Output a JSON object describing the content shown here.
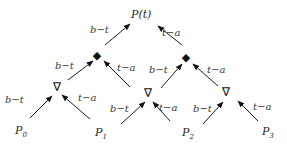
{
  "diagram": {
    "type": "de-casteljau-pyramid",
    "root": {
      "label": "P(t)"
    },
    "weights": {
      "left": "b−t",
      "right": "t−a"
    },
    "level_symbols": {
      "level1": "∇",
      "level2": "◆"
    },
    "control_points": [
      {
        "base": "P",
        "sub": "0"
      },
      {
        "base": "P",
        "sub": "1"
      },
      {
        "base": "P",
        "sub": "2"
      },
      {
        "base": "P",
        "sub": "3"
      }
    ],
    "edges": [
      {
        "from": "P0",
        "to": "L1a",
        "label": "b−t"
      },
      {
        "from": "P1",
        "to": "L1a",
        "label": "t−a"
      },
      {
        "from": "P1",
        "to": "L1b",
        "label": "b−t"
      },
      {
        "from": "P2",
        "to": "L1b",
        "label": "t−a"
      },
      {
        "from": "P2",
        "to": "L1c",
        "label": "b−t"
      },
      {
        "from": "P3",
        "to": "L1c",
        "label": "t−a"
      },
      {
        "from": "L1a",
        "to": "L2a",
        "label": "b−t"
      },
      {
        "from": "L1b",
        "to": "L2a",
        "label": "t−a"
      },
      {
        "from": "L1b",
        "to": "L2b",
        "label": "b−t"
      },
      {
        "from": "L1c",
        "to": "L2b",
        "label": "t−a"
      },
      {
        "from": "L2a",
        "to": "root",
        "label": "b−t"
      },
      {
        "from": "L2b",
        "to": "root",
        "label": "t−a"
      }
    ]
  }
}
